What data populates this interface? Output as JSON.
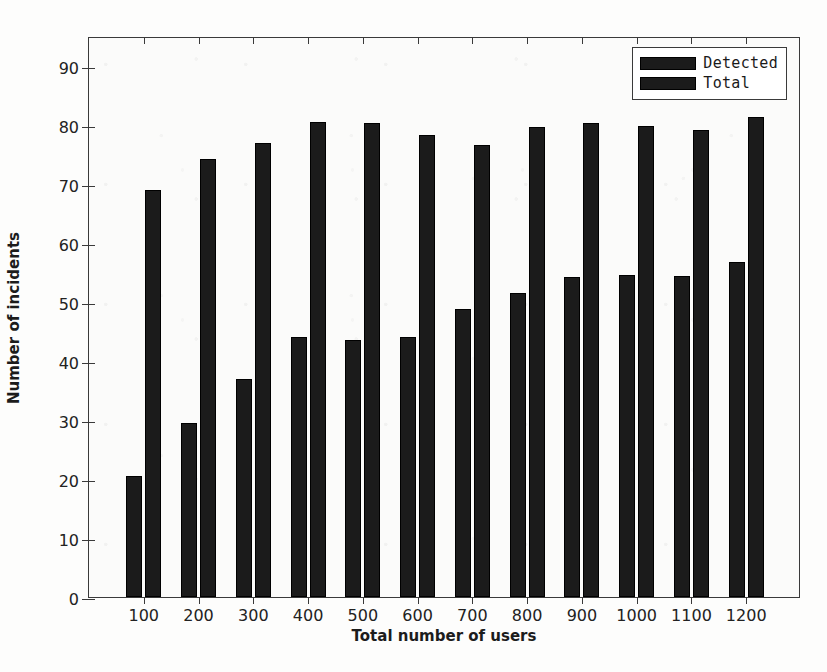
{
  "chart_data": {
    "type": "bar",
    "title": "",
    "xlabel": "Total number of users",
    "ylabel": "Number of incidents",
    "categories": [
      "100",
      "200",
      "300",
      "400",
      "500",
      "600",
      "700",
      "800",
      "900",
      "1000",
      "1100",
      "1200"
    ],
    "series": [
      {
        "name": "Detected",
        "color": "#1b1b1b",
        "values": [
          20.5,
          29.5,
          37.0,
          44.0,
          43.5,
          44.0,
          48.7,
          51.5,
          54.2,
          54.6,
          54.3,
          56.7
        ]
      },
      {
        "name": "Total",
        "color": "#1b1b1b",
        "values": [
          69.0,
          74.1,
          76.8,
          80.4,
          80.2,
          78.3,
          76.5,
          79.6,
          80.3,
          79.7,
          79.0,
          81.3
        ]
      }
    ],
    "ylim": [
      0,
      95
    ],
    "yticks": [
      0,
      10,
      20,
      30,
      40,
      50,
      60,
      70,
      80,
      90
    ],
    "ytick_labels": [
      "0",
      "10",
      "20",
      "30",
      "40",
      "50",
      "60",
      "70",
      "80",
      "90"
    ],
    "xlim": [
      0,
      13
    ],
    "grid": false,
    "legend_position": "top-right",
    "legend_entries": [
      "Detected",
      "Total"
    ]
  },
  "axes": {
    "y_title": "Number of incidents",
    "x_title": "Total number of users"
  },
  "legend": {
    "items": [
      {
        "label": "Detected"
      },
      {
        "label": "Total"
      }
    ]
  }
}
